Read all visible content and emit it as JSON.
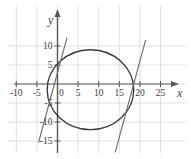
{
  "figure": {
    "name": "circle-and-lines-graph",
    "background": "#ffffff",
    "grid_color": "#d9dde4",
    "axis_color": "#58585a",
    "curve_color": "#3a3a3c",
    "line_color": "#6e6e70",
    "label_color": "#414143",
    "perforation_color": "#6b6b6d"
  },
  "axes": {
    "x_label": "x",
    "y_label": "y",
    "x_ticks": [
      "-10",
      "-5",
      "0",
      "5",
      "10",
      "15",
      "20",
      "25"
    ],
    "x_tick_values": [
      -10,
      -5,
      0,
      5,
      10,
      15,
      20,
      25
    ],
    "y_ticks": [
      "10",
      "5",
      "0",
      "-5",
      "-10",
      "-15"
    ],
    "y_tick_values": [
      10,
      5,
      0,
      -5,
      -10,
      -15
    ],
    "origin_label": "0",
    "xlim": [
      -13,
      29
    ],
    "ylim": [
      -18,
      14
    ],
    "grid_step": 5,
    "grid": true
  },
  "chart_data": {
    "type": "scatter",
    "title": "",
    "xlabel": "x",
    "ylabel": "y",
    "xlim": [
      -13,
      29
    ],
    "ylim": [
      -18,
      14
    ],
    "grid": true,
    "legend": "none",
    "series": [
      {
        "name": "circle",
        "kind": "circle",
        "center_x": 8,
        "center_y": -1.5,
        "radius": 10.5
      },
      {
        "name": "line-left",
        "kind": "line",
        "slope": 4.0,
        "intercept": 3.0,
        "x_from": -4.6,
        "x_to": 2.3
      },
      {
        "name": "line-right",
        "kind": "line",
        "slope": 4.0,
        "intercept": -74.0,
        "x_from": 14.0,
        "x_to": 21.4
      }
    ]
  }
}
